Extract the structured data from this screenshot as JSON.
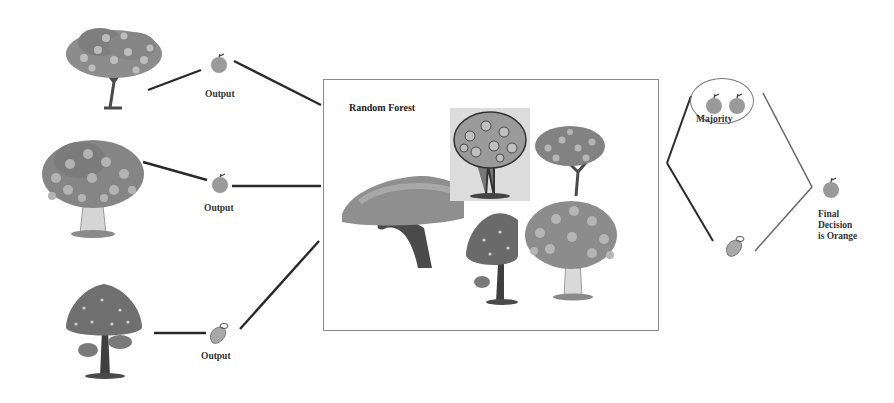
{
  "diagram": {
    "title": "Random Forest",
    "colors": {
      "line_dark": "#2a2a2a",
      "line_light": "#6a6a6a",
      "box_border": "#8a8a8a",
      "fruit_fill": "#9a9a9a",
      "foliage": "#8c8c8c",
      "trunk": "#4a4a4a"
    },
    "decision_trees": [
      {
        "id": "tree-1",
        "output_label": "Output",
        "output_fruit": "orange"
      },
      {
        "id": "tree-2",
        "output_label": "Output",
        "output_fruit": "orange"
      },
      {
        "id": "tree-3",
        "output_label": "Output",
        "output_fruit": "mango"
      }
    ],
    "forest_box": {
      "title": "Random Forest",
      "tree_count": 5
    },
    "voting": {
      "majority_label": "Majority",
      "majority_fruits": [
        "orange",
        "orange"
      ],
      "minority_fruit": "mango",
      "final_label_lines": [
        "Final",
        "Decision",
        "is Orange"
      ],
      "final_fruit": "orange"
    }
  }
}
